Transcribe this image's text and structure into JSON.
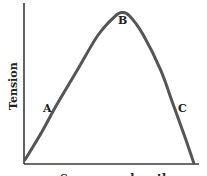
{
  "chart_data": {
    "type": "line",
    "title": "",
    "xlabel": "Sarcomere length",
    "ylabel": "Tension",
    "grid": false,
    "legend": null,
    "x_ticks": [],
    "y_ticks": [],
    "xlim": [
      0,
      1
    ],
    "ylim": [
      0,
      1
    ],
    "series": [
      {
        "name": "Length-tension curve",
        "x": [
          0.0,
          0.1,
          0.18,
          0.3,
          0.42,
          0.52,
          0.56,
          0.6,
          0.68,
          0.78,
          0.85,
          0.92,
          0.97
        ],
        "values": [
          0.02,
          0.2,
          0.36,
          0.58,
          0.8,
          0.92,
          0.94,
          0.92,
          0.8,
          0.58,
          0.37,
          0.16,
          0.0
        ]
      }
    ],
    "annotations": [
      {
        "text": "A",
        "x": 0.18,
        "y": 0.36,
        "note": "ascending limb"
      },
      {
        "text": "B",
        "x": 0.56,
        "y": 0.94,
        "note": "peak / optimal length"
      },
      {
        "text": "C",
        "x": 0.85,
        "y": 0.37,
        "note": "descending limb"
      }
    ]
  },
  "labels": {
    "y_axis": "Tension",
    "x_axis": "Sarcomere length",
    "point_a": "A",
    "point_b": "B",
    "point_c": "C"
  },
  "colors": {
    "curve": "#555555",
    "axes": "#3a3a3a",
    "text": "#222222",
    "background": "#ffffff"
  }
}
